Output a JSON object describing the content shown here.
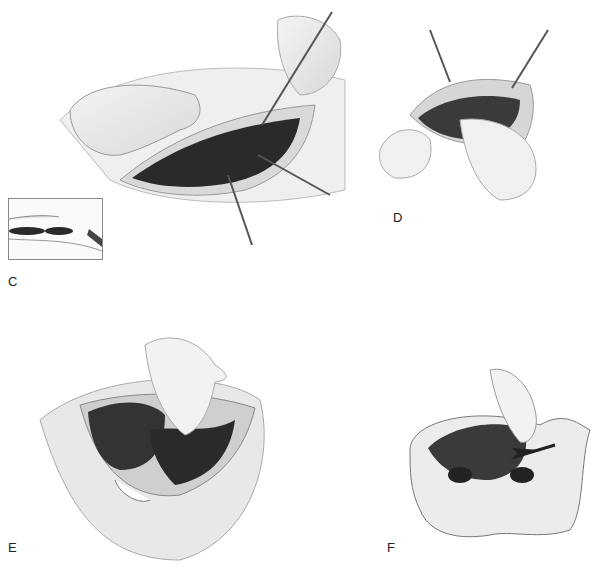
{
  "figure": {
    "panels": [
      {
        "id": "C",
        "label": "C",
        "description": "Incision opened with hand retracting and clamps on fascia edges; inset showing cross-section"
      },
      {
        "id": "D",
        "label": "D",
        "description": "Two clamps elevating fascia while hands explore abdominal cavity"
      },
      {
        "id": "E",
        "label": "E",
        "description": "Gloved hand reaching into pelvis beside dark organ mass"
      },
      {
        "id": "F",
        "label": "F",
        "description": "Cross-section of pelvis with hand displacing organ; arrow indicating direction"
      }
    ],
    "colors": {
      "background": "#ffffff",
      "ink": "#222222",
      "organ_dark": "#3a3a3a",
      "tissue_light": "#e4e4e4"
    }
  }
}
